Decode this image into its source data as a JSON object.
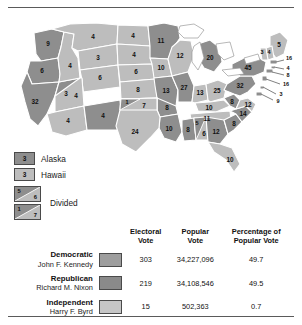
{
  "map": {
    "title": "1960 Presidential Election Electoral Vote Map",
    "colors": {
      "democratic": "#8e8e8e",
      "republican": "#bdbdbd",
      "independent": "#c6c6c6",
      "border": "#ffffff",
      "water": "#ffffff"
    },
    "states": [
      {
        "code": "WA",
        "votes": "9",
        "party": "dem"
      },
      {
        "code": "OR",
        "votes": "6",
        "party": "dem"
      },
      {
        "code": "CA",
        "votes": "32",
        "party": "dem"
      },
      {
        "code": "NV",
        "votes": "3",
        "party": "dem"
      },
      {
        "code": "ID",
        "votes": "4",
        "party": "rep"
      },
      {
        "code": "MT",
        "votes": "4",
        "party": "rep"
      },
      {
        "code": "WY",
        "votes": "3",
        "party": "rep"
      },
      {
        "code": "UT",
        "votes": "4",
        "party": "rep"
      },
      {
        "code": "AZ",
        "votes": "4",
        "party": "rep"
      },
      {
        "code": "CO",
        "votes": "6",
        "party": "rep"
      },
      {
        "code": "NM",
        "votes": "4",
        "party": "dem"
      },
      {
        "code": "ND",
        "votes": "4",
        "party": "rep"
      },
      {
        "code": "SD",
        "votes": "4",
        "party": "rep"
      },
      {
        "code": "NE",
        "votes": "6",
        "party": "rep"
      },
      {
        "code": "KS",
        "votes": "8",
        "party": "rep"
      },
      {
        "code": "MN",
        "votes": "11",
        "party": "dem"
      },
      {
        "code": "IA",
        "votes": "10",
        "party": "rep"
      },
      {
        "code": "MO",
        "votes": "13",
        "party": "dem"
      },
      {
        "code": "WI",
        "votes": "12",
        "party": "rep"
      },
      {
        "code": "IL",
        "votes": "27",
        "party": "dem"
      },
      {
        "code": "MI",
        "votes": "20",
        "party": "dem"
      },
      {
        "code": "IN",
        "votes": "13",
        "party": "rep"
      },
      {
        "code": "OH",
        "votes": "25",
        "party": "rep"
      },
      {
        "code": "KY",
        "votes": "10",
        "party": "rep"
      },
      {
        "code": "TN",
        "votes": "11",
        "party": "rep"
      },
      {
        "code": "WV",
        "votes": "8",
        "party": "dem"
      },
      {
        "code": "VA",
        "votes": "12",
        "party": "rep"
      },
      {
        "code": "NC",
        "votes": "14",
        "party": "dem"
      },
      {
        "code": "SC",
        "votes": "8",
        "party": "dem"
      },
      {
        "code": "GA",
        "votes": "12",
        "party": "dem"
      },
      {
        "code": "FL",
        "votes": "10",
        "party": "rep"
      },
      {
        "code": "AR",
        "votes": "8",
        "party": "dem"
      },
      {
        "code": "LA",
        "votes": "10",
        "party": "dem"
      },
      {
        "code": "MS",
        "votes": "8",
        "party": "dem"
      },
      {
        "code": "TX",
        "votes": "24",
        "party": "dem"
      },
      {
        "code": "PA",
        "votes": "32",
        "party": "dem"
      },
      {
        "code": "NY",
        "votes": "45",
        "party": "dem"
      },
      {
        "code": "ME",
        "votes": "5",
        "party": "rep"
      },
      {
        "code": "NH",
        "votes": "4",
        "party": "rep"
      },
      {
        "code": "VT",
        "votes": "3",
        "party": "rep"
      }
    ],
    "callouts": [
      {
        "code": "MA",
        "votes": "16"
      },
      {
        "code": "RI",
        "votes": "4"
      },
      {
        "code": "CT",
        "votes": "8"
      },
      {
        "code": "NJ",
        "votes": "16"
      },
      {
        "code": "DE",
        "votes": "3"
      },
      {
        "code": "MD",
        "votes": "9"
      }
    ]
  },
  "legend": {
    "alaska": {
      "votes": "3",
      "label": "Alaska"
    },
    "hawaii": {
      "votes": "3",
      "label": "Hawaii"
    },
    "divided_label": "Divided",
    "divided": [
      {
        "state": "AL",
        "dem_votes": "5",
        "rep_votes": "6"
      },
      {
        "state": "OK",
        "dem_votes": "1",
        "rep_votes": "7"
      }
    ]
  },
  "table": {
    "headers": {
      "electoral": "Electoral\nVote",
      "electoral_line1": "Electoral",
      "electoral_line2": "Vote",
      "popular_line1": "Popular",
      "popular_line2": "Vote",
      "percent_line1": "Percentage of",
      "percent_line2": "Popular Vote"
    },
    "rows": [
      {
        "party": "Democratic",
        "candidate": "John F. Kennedy",
        "electoral_vote": "303",
        "popular_vote": "34,227,096",
        "percent_popular": "49.7"
      },
      {
        "party": "Republican",
        "candidate": "Richard M. Nixon",
        "electoral_vote": "219",
        "popular_vote": "34,108,546",
        "percent_popular": "49.5"
      },
      {
        "party": "Independent",
        "candidate": "Harry F. Byrd",
        "electoral_vote": "15",
        "popular_vote": "502,363",
        "percent_popular": "0.7"
      }
    ]
  }
}
